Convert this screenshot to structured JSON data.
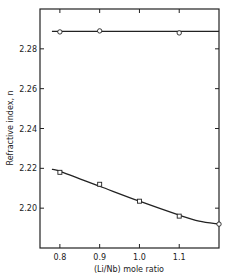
{
  "chart_data": {
    "type": "scatter",
    "title": "",
    "xlabel": "(Li/Nb) mole ratio",
    "ylabel": "Refractive index, n",
    "xlim": [
      0.75,
      1.2
    ],
    "ylim": [
      2.18,
      2.3
    ],
    "x_ticks": [
      0.8,
      0.9,
      1.0,
      1.1
    ],
    "x_tick_labels": [
      "0.8",
      "0.9",
      "1.0",
      "1.1"
    ],
    "y_ticks": [
      2.2,
      2.22,
      2.24,
      2.26,
      2.28
    ],
    "y_tick_labels": [
      "2.20",
      "2.22",
      "2.24",
      "2.26",
      "2.28"
    ],
    "grid": false,
    "legend": "none",
    "series": [
      {
        "name": "upper (circles)",
        "marker": "circle",
        "x": [
          0.8,
          0.9,
          1.1
        ],
        "y": [
          2.2885,
          2.289,
          2.288
        ],
        "fit_line": {
          "shape": "horizontal",
          "x": [
            0.78,
            1.2
          ],
          "y": [
            2.2888,
            2.2888
          ]
        }
      },
      {
        "name": "lower (squares)",
        "marker": "square",
        "x": [
          0.8,
          0.9,
          1.0,
          1.1,
          1.2
        ],
        "y": [
          2.218,
          2.212,
          2.2035,
          2.196,
          2.192
        ],
        "fit_line": {
          "shape": "curve",
          "x": [
            0.78,
            0.8,
            0.9,
            1.0,
            1.1,
            1.15,
            1.2
          ],
          "y": [
            2.2195,
            2.2185,
            2.211,
            2.2035,
            2.1965,
            2.1935,
            2.192
          ]
        }
      }
    ]
  }
}
